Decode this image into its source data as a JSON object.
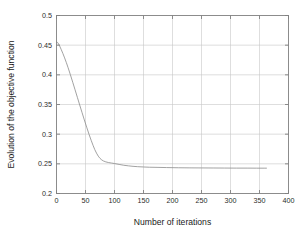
{
  "chart_data": {
    "type": "line",
    "title": "",
    "subtitle": "",
    "xlabel": "Number of iterations",
    "ylabel": "Evolution of the objective function",
    "xlim": [
      0,
      400
    ],
    "ylim": [
      0.2,
      0.5
    ],
    "xticks": [
      0,
      50,
      100,
      150,
      200,
      250,
      300,
      350,
      400
    ],
    "xtick_labels": [
      "0",
      "50",
      "100",
      "150",
      "200",
      "250",
      "300",
      "350",
      "400"
    ],
    "yticks": [
      0.2,
      0.25,
      0.3,
      0.35,
      0.4,
      0.45,
      0.5
    ],
    "ytick_labels": [
      "0.2",
      "0.25",
      "0.3",
      "0.35",
      "0.4",
      "0.45",
      "0.5"
    ],
    "grid": true,
    "grid_color": "#c8c8c8",
    "axis_color": "#808080",
    "background": "#ffffff",
    "legend": null,
    "legend_position": "none",
    "annotations": [],
    "series": [
      {
        "name": "objective",
        "color": "#8a8a8a",
        "line_width": 0.8,
        "x": [
          0,
          2,
          5,
          8,
          11,
          14,
          17,
          20,
          24,
          28,
          32,
          36,
          40,
          44,
          48,
          52,
          56,
          60,
          63,
          66,
          69,
          72,
          75,
          78,
          81,
          85,
          90,
          95,
          100,
          108,
          116,
          124,
          132,
          140,
          150,
          160,
          175,
          190,
          210,
          230,
          250,
          270,
          290,
          310,
          330,
          345,
          358,
          362
        ],
        "y": [
          0.4555,
          0.4545,
          0.4495,
          0.443,
          0.436,
          0.4285,
          0.4205,
          0.412,
          0.4,
          0.3875,
          0.3748,
          0.362,
          0.3492,
          0.3365,
          0.324,
          0.3118,
          0.3,
          0.289,
          0.2812,
          0.274,
          0.268,
          0.263,
          0.2592,
          0.2566,
          0.2548,
          0.2533,
          0.2521,
          0.2513,
          0.2505,
          0.249,
          0.2476,
          0.2466,
          0.2458,
          0.2452,
          0.2447,
          0.2443,
          0.244,
          0.2437,
          0.2434,
          0.2432,
          0.2431,
          0.243,
          0.2429,
          0.2428,
          0.2428,
          0.2427,
          0.2427,
          0.2427
        ]
      }
    ]
  }
}
